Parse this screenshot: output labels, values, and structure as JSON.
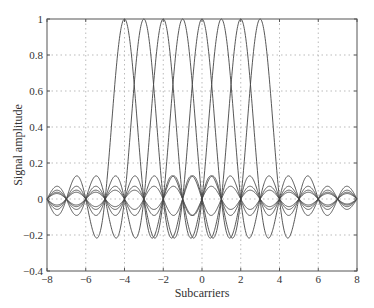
{
  "chart_data": {
    "type": "line",
    "title": "",
    "xlabel": "Subcarriers",
    "ylabel": "Signal amplitude",
    "xlim": [
      -8,
      8
    ],
    "ylim": [
      -0.4,
      1
    ],
    "xticks": [
      -8,
      -6,
      -4,
      -2,
      0,
      2,
      4,
      6,
      8
    ],
    "yticks": [
      -0.4,
      -0.2,
      0,
      0.2,
      0.4,
      0.6,
      0.8,
      1
    ],
    "ytick_labels": [
      "−0.4",
      "−0.2",
      "0",
      "0.2",
      "0.4",
      "0.6",
      "0.8",
      "1"
    ],
    "xtick_labels": [
      "−8",
      "−6",
      "−4",
      "−2",
      "0",
      "2",
      "4",
      "6",
      "8"
    ],
    "grid": true,
    "legend": null,
    "series": [
      {
        "name": "subcarrier 1",
        "function": "sinc(x - c)",
        "center": -4
      },
      {
        "name": "subcarrier 2",
        "function": "sinc(x - c)",
        "center": -3
      },
      {
        "name": "subcarrier 3",
        "function": "sinc(x - c)",
        "center": -2
      },
      {
        "name": "subcarrier 4",
        "function": "sinc(x - c)",
        "center": -1
      },
      {
        "name": "subcarrier 5",
        "function": "sinc(x - c)",
        "center": 0
      },
      {
        "name": "subcarrier 6",
        "function": "sinc(x - c)",
        "center": 1
      },
      {
        "name": "subcarrier 7",
        "function": "sinc(x - c)",
        "center": 2
      },
      {
        "name": "subcarrier 8",
        "function": "sinc(x - c)",
        "center": 3
      }
    ],
    "peak_value": 1,
    "min_sidelobe": -0.217
  }
}
